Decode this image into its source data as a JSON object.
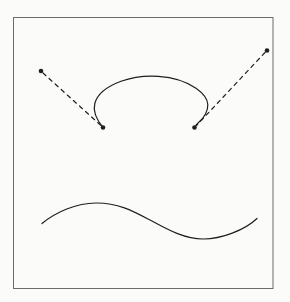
{
  "figure": {
    "canvas": {
      "width": 290,
      "height": 302,
      "background": "#fbfbf9"
    },
    "ink_color": "#1f1f1f",
    "frame": {
      "x": 13.5,
      "y": 17.5,
      "width": 259.5,
      "height": 271,
      "stroke": "#6b6b6b"
    },
    "dash_pattern": "4 4.2",
    "points": [
      {
        "name": "upper-left-dot",
        "x": 41,
        "y": 71,
        "r": 2.3
      },
      {
        "name": "loop-left-dot",
        "x": 103,
        "y": 127.5,
        "r": 2.3
      },
      {
        "name": "loop-right-dot",
        "x": 194.5,
        "y": 127.5,
        "r": 2.3
      },
      {
        "name": "upper-right-dot",
        "x": 267,
        "y": 50.5,
        "r": 2.3
      }
    ],
    "dashed_lines": [
      {
        "name": "left-tangent",
        "x1": 43,
        "y1": 73,
        "x2": 101,
        "y2": 125.5
      },
      {
        "name": "right-tangent",
        "x1": 265,
        "y1": 52.5,
        "x2": 196.5,
        "y2": 125.5
      }
    ],
    "curves": {
      "loop": "M 103,127.5 C 96.5,119.5 92.8,111 94.8,103.5 C 97.2,94.5 107,86.5 121,81.3 C 133,76.9 146,75.5 158.5,76.3 C 172.5,77.2 186.5,81.6 196,88.2 C 203,93.1 207.5,99 207.8,104.5 C 208.1,110.5 204.5,117.5 199.3,121.8 C 196.9,123.8 195.8,125.5 194.5,127.5",
      "wave": "M 42,223.5 C 56,212 76,203.2 96,203 C 118,202.8 133,211 150,220 C 166,228.5 183,238.8 203,239 C 221,239.2 245,230 257,218.5"
    }
  }
}
